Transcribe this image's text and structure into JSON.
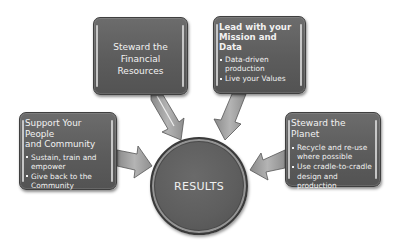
{
  "diagram": {
    "center": {
      "label": "RESULTS"
    },
    "nodes": [
      {
        "id": "financial",
        "title": "Steward the Financial Resources",
        "title_lines": [
          "Steward the",
          "Financial Resources"
        ],
        "bullets": []
      },
      {
        "id": "mission",
        "title": "Lead with your Mission and Data",
        "title_lines": [
          "Lead with your",
          "Mission and Data"
        ],
        "bullets": [
          "Data-driven production",
          "Live  your Values"
        ]
      },
      {
        "id": "people",
        "title": "Support Your People and Community",
        "title_lines": [
          "Support  Your People",
          "and Community"
        ],
        "bullets": [
          "Sustain, train and empower",
          "Give back to the Community"
        ]
      },
      {
        "id": "planet",
        "title": "Steward the Planet",
        "title_lines": [
          "Steward the Planet"
        ],
        "bullets": [
          "Recycle  and re-use where possible",
          "Use cradle-to-cradle design and production"
        ]
      }
    ],
    "edges": [
      {
        "from": "financial",
        "to": "center"
      },
      {
        "from": "mission",
        "to": "center"
      },
      {
        "from": "people",
        "to": "center"
      },
      {
        "from": "planet",
        "to": "center"
      }
    ],
    "colors": {
      "box_fill": "#5e5e5e",
      "box_border": "#3f3f3f",
      "text": "#f2f2f2",
      "arrow_fill": "#9a9a9a",
      "background": "#ffffff"
    }
  }
}
